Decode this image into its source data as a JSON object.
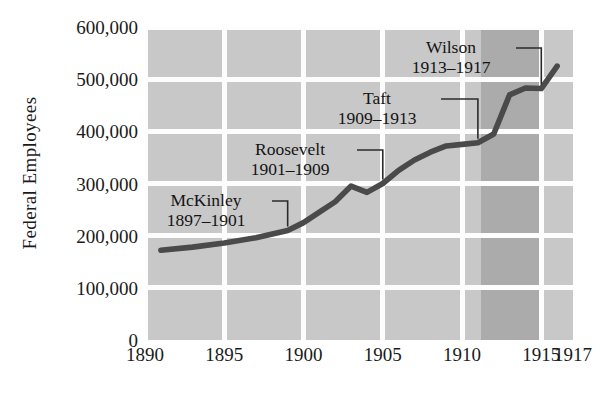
{
  "chart_data": {
    "type": "line",
    "title": "",
    "xlabel": "",
    "ylabel": "Federal Employees",
    "xlim": [
      1890,
      1917
    ],
    "ylim": [
      0,
      600000
    ],
    "grid": true,
    "legend": "none",
    "line_color": "#4a4a4a",
    "plot_background": "#c8c8c8",
    "gridline_color": "#fdfdfd",
    "shade_band_color": "#ababab",
    "x_tick_labels": [
      "1890",
      "1895",
      "1900",
      "1905",
      "1910",
      "1915",
      "1917"
    ],
    "x_tick_values": [
      1890,
      1895,
      1900,
      1905,
      1910,
      1915,
      1917
    ],
    "y_tick_labels": [
      "0",
      "100,000",
      "200,000",
      "300,000",
      "400,000",
      "500,000",
      "600,000"
    ],
    "y_tick_values": [
      0,
      100000,
      200000,
      300000,
      400000,
      500000,
      600000
    ],
    "x": [
      1891,
      1893,
      1895,
      1897,
      1899,
      1900,
      1901,
      1902,
      1903,
      1904,
      1905,
      1906,
      1907,
      1908,
      1909,
      1910,
      1911,
      1912,
      1913,
      1914,
      1915,
      1916
    ],
    "values": [
      172000,
      178000,
      186000,
      196000,
      210000,
      225000,
      245000,
      265000,
      295000,
      283000,
      300000,
      325000,
      345000,
      360000,
      372000,
      375000,
      378000,
      395000,
      470000,
      483000,
      482000,
      525000
    ],
    "annotations": [
      {
        "name": "McKinley",
        "years": "1897–1901",
        "x_target": 1899,
        "y_target": 210000
      },
      {
        "name": "Roosevelt",
        "years": "1901–1909",
        "x_target": 1905,
        "y_target": 300000
      },
      {
        "name": "Taft",
        "years": "1909–1913",
        "x_target": 1911,
        "y_target": 378000
      },
      {
        "name": "Wilson",
        "years": "1913–1917",
        "x_target": 1915,
        "y_target": 482000
      }
    ]
  }
}
